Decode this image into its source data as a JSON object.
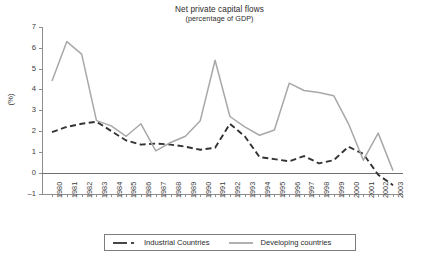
{
  "chart_data": {
    "type": "line",
    "title": "Net private capital flows",
    "subtitle": "(percentage of GDP)",
    "xlabel": "",
    "ylabel": "(%)",
    "ylim": [
      -1,
      7
    ],
    "yticks": [
      -1,
      0,
      1,
      2,
      3,
      4,
      5,
      6,
      7
    ],
    "grid": false,
    "legend_position": "bottom",
    "categories": [
      "1980",
      "1981",
      "1982",
      "1983",
      "1984",
      "1985",
      "1986",
      "1987",
      "1988",
      "1989",
      "1990",
      "1991",
      "1992",
      "1993",
      "1994",
      "1995",
      "1996",
      "1997",
      "1998",
      "1999",
      "2000",
      "2001",
      "2002",
      "2003"
    ],
    "series": [
      {
        "name": "Industrial Countries",
        "color": "#333333",
        "style": "dashed",
        "values": [
          1.95,
          2.2,
          2.35,
          2.45,
          2.0,
          1.55,
          1.35,
          1.4,
          1.35,
          1.25,
          1.1,
          1.2,
          2.35,
          1.75,
          0.75,
          0.65,
          0.55,
          0.8,
          0.45,
          0.6,
          1.25,
          0.9,
          -0.1,
          -0.6
        ]
      },
      {
        "name": "Developing countries",
        "color": "#a8a8a8",
        "style": "solid",
        "values": [
          4.4,
          6.3,
          5.7,
          2.5,
          2.25,
          1.75,
          2.35,
          1.05,
          1.45,
          1.75,
          2.5,
          5.4,
          2.7,
          2.2,
          1.8,
          2.05,
          4.3,
          3.95,
          3.85,
          3.7,
          2.35,
          0.6,
          1.9,
          0.1
        ]
      }
    ]
  },
  "legend": {
    "items": [
      {
        "label": "Industrial Countries"
      },
      {
        "label": "Developing countries"
      }
    ]
  }
}
